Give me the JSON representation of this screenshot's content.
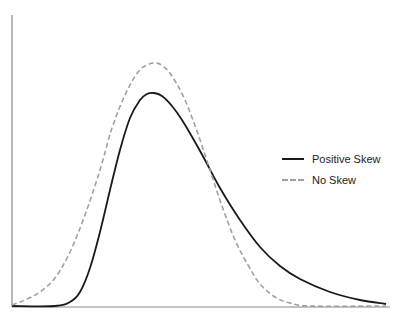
{
  "chart_data": {
    "type": "line",
    "title": "",
    "xlabel": "",
    "ylabel": "",
    "grid": false,
    "legend_position": "right",
    "axes": {
      "x_ticks": [],
      "y_ticks": []
    },
    "series": [
      {
        "name": "Positive Skew",
        "style": "solid",
        "color": "#1a1a1a",
        "points_px": [
          [
            12,
            306
          ],
          [
            55,
            306
          ],
          [
            70,
            302
          ],
          [
            80,
            292
          ],
          [
            90,
            268
          ],
          [
            100,
            232
          ],
          [
            110,
            190
          ],
          [
            120,
            150
          ],
          [
            130,
            118
          ],
          [
            140,
            100
          ],
          [
            147,
            94
          ],
          [
            154,
            93
          ],
          [
            162,
            96
          ],
          [
            172,
            106
          ],
          [
            182,
            120
          ],
          [
            195,
            142
          ],
          [
            205,
            160
          ],
          [
            220,
            188
          ],
          [
            240,
            220
          ],
          [
            260,
            247
          ],
          [
            280,
            266
          ],
          [
            300,
            279
          ],
          [
            330,
            292
          ],
          [
            360,
            300
          ],
          [
            386,
            304
          ]
        ]
      },
      {
        "name": "No Skew",
        "style": "dashed",
        "color": "#a0a0a0",
        "points_px": [
          [
            12,
            305
          ],
          [
            25,
            300
          ],
          [
            40,
            292
          ],
          [
            55,
            278
          ],
          [
            70,
            252
          ],
          [
            85,
            215
          ],
          [
            100,
            170
          ],
          [
            112,
            128
          ],
          [
            125,
            95
          ],
          [
            138,
            72
          ],
          [
            147,
            65
          ],
          [
            155,
            63
          ],
          [
            163,
            66
          ],
          [
            172,
            76
          ],
          [
            185,
            100
          ],
          [
            198,
            134
          ],
          [
            210,
            170
          ],
          [
            222,
            206
          ],
          [
            235,
            240
          ],
          [
            248,
            265
          ],
          [
            260,
            284
          ],
          [
            275,
            297
          ],
          [
            290,
            303
          ],
          [
            310,
            306
          ],
          [
            386,
            306
          ]
        ]
      }
    ]
  },
  "legend": {
    "items": [
      {
        "label": "Positive Skew",
        "style": "solid"
      },
      {
        "label": "No Skew",
        "style": "dashed"
      }
    ]
  }
}
